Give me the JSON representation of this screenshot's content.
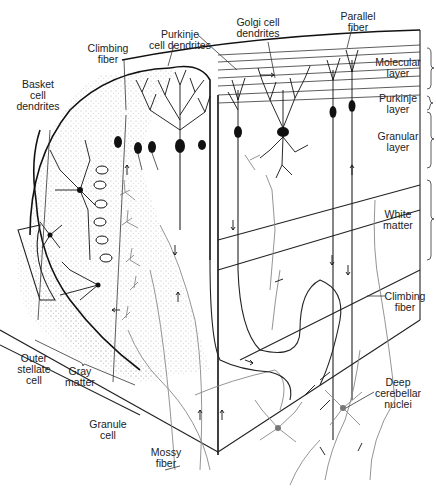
{
  "diagram": {
    "labels": {
      "parallel_fiber": [
        "Parallel",
        "fiber"
      ],
      "golgi_cell_dendrites": [
        "Golgi cell",
        "dendrites"
      ],
      "purkinje_cell_dendrites": [
        "Purkinje",
        "cell dendrites"
      ],
      "climbing_fiber_top": [
        "Climbing",
        "fiber"
      ],
      "basket_cell_dendrites": [
        "Basket",
        "cell",
        "dendrites"
      ],
      "molecular_layer": [
        "Molecular",
        "layer"
      ],
      "purkinje_layer": [
        "Purkinje",
        "layer"
      ],
      "granular_layer": [
        "Granular",
        "layer"
      ],
      "white_matter": [
        "White",
        "matter"
      ],
      "climbing_fiber_right": [
        "Climbing",
        "fiber"
      ],
      "deep_cerebellar_nuclei": [
        "Deep",
        "cerebellar",
        "nuclei"
      ],
      "outer_stellate_cell": [
        "Outer",
        "stellate",
        "cell"
      ],
      "gray_matter": [
        "Gray",
        "matter"
      ],
      "granule_cell": [
        "Granule",
        "cell"
      ],
      "mossy_fiber": [
        "Mossy",
        "fiber"
      ]
    },
    "layers_bracketed": [
      "Molecular layer",
      "Purkinje layer",
      "Granular layer",
      "White matter"
    ],
    "colors": {
      "ink": "#111111",
      "gray_fibers": "#888888",
      "background": "#ffffff"
    }
  }
}
